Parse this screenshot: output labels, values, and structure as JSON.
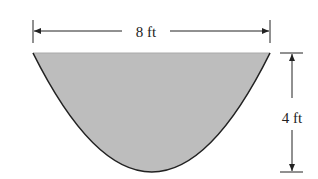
{
  "diagram": {
    "shape": "parabolic cross-section (trough) filled with water",
    "width_label": "8 ft",
    "height_label": "4 ft",
    "colors": {
      "fill": "#bdbdbd",
      "stroke": "#222222",
      "background": "#ffffff"
    }
  }
}
